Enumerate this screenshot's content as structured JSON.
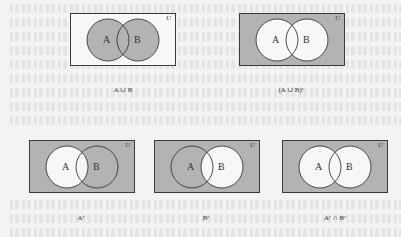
{
  "figure": {
    "universe_label": "U",
    "set_a_label": "A",
    "set_b_label": "B",
    "colors": {
      "shaded": "#b3b3b3",
      "unshaded": "#f7f7f5",
      "outline": "#3a3a3a",
      "page": "#f3f3f1"
    },
    "panels": [
      {
        "id": "a-union-b",
        "caption": "A ∪ B",
        "shade": "union"
      },
      {
        "id": "a-union-b-complement",
        "caption": "(A ∪ B)ᶜ",
        "shade": "complement-of-union"
      },
      {
        "id": "a-complement",
        "caption": "Aᶜ",
        "shade": "outside-a"
      },
      {
        "id": "b-complement",
        "caption": "Bᶜ",
        "shade": "outside-b"
      },
      {
        "id": "a-complement-intersect-b-complement",
        "caption": "Aᶜ ∩ Bᶜ",
        "shade": "outside-both"
      }
    ]
  }
}
